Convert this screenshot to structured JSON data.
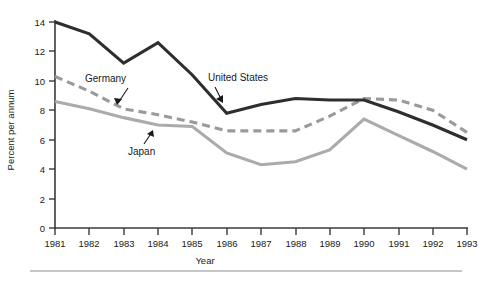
{
  "chart_data": {
    "type": "line",
    "title": "",
    "xlabel": "Year",
    "ylabel": "Percent per annum",
    "x": [
      1981,
      1982,
      1983,
      1984,
      1985,
      1986,
      1987,
      1988,
      1989,
      1990,
      1991,
      1992,
      1993
    ],
    "xticklabels": [
      "1981",
      "1982",
      "1983",
      "1984",
      "1985",
      "1986",
      "1987",
      "1988",
      "1989",
      "1990",
      "1991",
      "1992",
      "1993"
    ],
    "yticks": [
      0,
      2,
      4,
      6,
      8,
      10,
      12,
      14
    ],
    "yticklabels": [
      "0",
      "2",
      "4",
      "6",
      "8",
      "10",
      "12",
      "14"
    ],
    "ylim": [
      0,
      14
    ],
    "xlim": [
      1981,
      1993
    ],
    "grid": false,
    "legend": "inline-annotations",
    "series": [
      {
        "name": "United States",
        "style": "solid",
        "color": "#2e2e2e",
        "values": [
          14.0,
          13.2,
          11.2,
          12.6,
          10.4,
          7.8,
          8.4,
          8.8,
          8.7,
          8.7,
          7.9,
          7.0,
          6.0
        ]
      },
      {
        "name": "Germany",
        "style": "dashed",
        "color": "#9a9a9a",
        "values": [
          10.3,
          9.3,
          8.1,
          7.7,
          7.2,
          6.6,
          6.6,
          6.6,
          7.6,
          8.8,
          8.7,
          8.0,
          6.5
        ]
      },
      {
        "name": "Japan",
        "style": "solid",
        "color": "#ababab",
        "values": [
          8.6,
          8.1,
          7.5,
          7.0,
          6.9,
          5.1,
          4.3,
          4.5,
          5.3,
          7.4,
          6.3,
          5.2,
          4.0
        ]
      }
    ],
    "annotations": [
      {
        "label": "United States",
        "points_to_series": "United States"
      },
      {
        "label": "Germany",
        "points_to_series": "Germany"
      },
      {
        "label": "Japan",
        "points_to_series": "Japan"
      }
    ]
  },
  "axes": {
    "ylabel": "Percent per annum",
    "xlabel": "Year"
  },
  "labels": {
    "united_states": "United States",
    "germany": "Germany",
    "japan": "Japan"
  }
}
